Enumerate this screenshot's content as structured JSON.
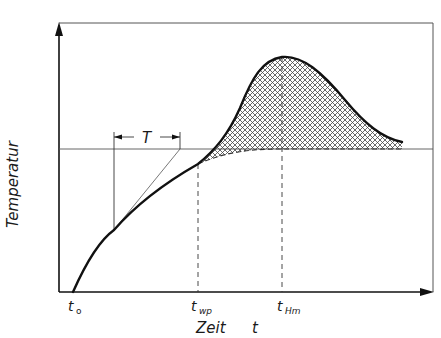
{
  "diagram": {
    "type": "temperature-time curve with exothermic peak",
    "y_axis_label": "Temperatur",
    "x_axis_label": "Zeit",
    "x_axis_symbol": "t",
    "ticks": [
      {
        "base": "t",
        "sub": "o",
        "label": "t_o",
        "x": 73
      },
      {
        "base": "t",
        "sub": "wp",
        "label": "t_wp",
        "x": 198
      },
      {
        "base": "t",
        "sub": "Hm",
        "label": "t_Hm",
        "x": 282
      }
    ],
    "interval_label": "T",
    "reference_line": "horizontal line at ambient temperature level",
    "hatched_region": "area between heating curve and extrapolated baseline (dashed) after t_wp",
    "colors": {
      "line": "#111111",
      "thin_line": "#555555",
      "hatch": "#444444",
      "background": "#ffffff"
    }
  }
}
